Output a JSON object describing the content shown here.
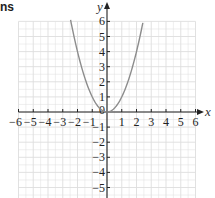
{
  "heading_fragment": "ns",
  "colors": {
    "grid": "#dedede",
    "axis": "#222222",
    "curve": "#8c8c8c",
    "background": "#ffffff"
  },
  "chart_data": {
    "type": "line",
    "title": "",
    "function": "y = x^2",
    "xlabel": "x",
    "ylabel": "y",
    "xlim": [
      -6,
      6
    ],
    "ylim": [
      -5.7,
      6
    ],
    "grid": true,
    "x_ticks": [
      -6,
      -5,
      -4,
      -3,
      -2,
      -1,
      1,
      2,
      3,
      4,
      5,
      6
    ],
    "y_ticks": [
      -5,
      -4,
      -3,
      -2,
      -1,
      1,
      2,
      3,
      4,
      5,
      6
    ],
    "x_tick_labels": [
      "−6",
      "−5",
      "−4",
      "−3",
      "−2",
      "−1",
      "1",
      "2",
      "3",
      "4",
      "5",
      "6"
    ],
    "y_tick_labels": [
      "−5",
      "−4",
      "−3",
      "−2",
      "−1",
      "1",
      "2",
      "3",
      "4",
      "5",
      "6"
    ],
    "origin_label": "0",
    "series": [
      {
        "name": "y = x²",
        "x": [
          -2.45,
          -2,
          -1.5,
          -1,
          -0.5,
          0,
          0.5,
          1,
          1.5,
          2,
          2.45
        ],
        "y": [
          6.0,
          4,
          2.25,
          1,
          0.25,
          0,
          0.25,
          1,
          2.25,
          4,
          6.0
        ]
      }
    ]
  }
}
